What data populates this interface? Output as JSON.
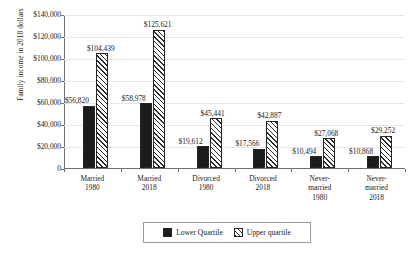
{
  "chart_data": {
    "type": "bar",
    "title": "",
    "xlabel": "",
    "ylabel": "Family income in 2018 dollars",
    "ylim": [
      0,
      140000
    ],
    "grid": true,
    "legend_position": "bottom-center",
    "ytick_labels": [
      "$140,000",
      "$120,000",
      "$100,000",
      "$80,000",
      "$60,000",
      "$40,000",
      "$20,000",
      "0"
    ],
    "ytick_values": [
      140000,
      120000,
      100000,
      80000,
      60000,
      40000,
      20000,
      0
    ],
    "categories": [
      "Married\n1980",
      "Married\n2018",
      "Divorced\n1980",
      "Divorced\n2018",
      "Never-\nmarried\n1980",
      "Never-\nmarried\n2018"
    ],
    "series": [
      {
        "name": "Lower Quartile",
        "style": "solid-black",
        "values": [
          56820,
          58978,
          19612,
          17566,
          10494,
          10868
        ],
        "labels": [
          "$56,820",
          "$58,978",
          "$19,612",
          "$17,566",
          "$10,494",
          "$10,868"
        ]
      },
      {
        "name": "Upper quartile",
        "style": "diagonal-hatch",
        "values": [
          104439,
          125621,
          45441,
          42887,
          27068,
          29252
        ],
        "labels": [
          "$104,439",
          "$125,621",
          "$45,441",
          "$42,887",
          "$27,068",
          "$29,252"
        ]
      }
    ]
  },
  "legend": {
    "entries": [
      {
        "label": "Lower Quartile",
        "swatch": "solid-black-swatch"
      },
      {
        "label": "Upper quartile",
        "swatch": "hatch-swatch"
      }
    ]
  },
  "colors": {
    "lower_quartile": "#1c1c1c",
    "upper_quartile_hatch": "#2b2b2b",
    "upper_quartile_fill": "#ffffff",
    "gridline": "#e6e6e6",
    "axis": "#6f6f6f",
    "text": "#1a1a1a",
    "background": "#ffffff",
    "legend_border": "#9a9a9a"
  }
}
